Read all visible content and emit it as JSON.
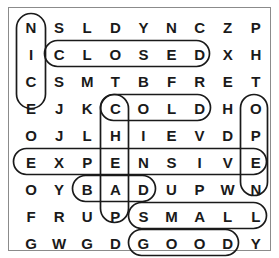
{
  "puzzle": {
    "title": "Word search puzzle grid",
    "rows": 9,
    "cols": 9,
    "border_color": "#8b8b8b",
    "letter_color": "#1a1a1a",
    "loop_color": "#1a1a1a",
    "grid": [
      [
        "N",
        "S",
        "L",
        "D",
        "Y",
        "N",
        "C",
        "Z",
        "P"
      ],
      [
        "I",
        "C",
        "L",
        "O",
        "S",
        "E",
        "D",
        "X",
        "H"
      ],
      [
        "C",
        "S",
        "M",
        "T",
        "B",
        "F",
        "R",
        "E",
        "T"
      ],
      [
        "E",
        "J",
        "K",
        "C",
        "O",
        "L",
        "D",
        "H",
        "O"
      ],
      [
        "O",
        "J",
        "L",
        "H",
        "I",
        "E",
        "V",
        "D",
        "P"
      ],
      [
        "E",
        "X",
        "P",
        "E",
        "N",
        "S",
        "I",
        "V",
        "E"
      ],
      [
        "O",
        "Y",
        "B",
        "A",
        "D",
        "U",
        "P",
        "W",
        "N"
      ],
      [
        "F",
        "R",
        "U",
        "P",
        "S",
        "M",
        "A",
        "L",
        "L"
      ],
      [
        "G",
        "W",
        "G",
        "D",
        "G",
        "O",
        "O",
        "D",
        "Y"
      ]
    ],
    "found_words": [
      {
        "word": "NICE",
        "direction": "vertical",
        "start_row": 1,
        "start_col": 1,
        "length": 4
      },
      {
        "word": "CLOSED",
        "direction": "horizontal",
        "start_row": 2,
        "start_col": 2,
        "length": 6
      },
      {
        "word": "COLD",
        "direction": "horizontal",
        "start_row": 4,
        "start_col": 4,
        "length": 4
      },
      {
        "word": "OPEN",
        "direction": "vertical",
        "start_row": 4,
        "start_col": 9,
        "length": 4
      },
      {
        "word": "CHEAP",
        "direction": "vertical",
        "start_row": 4,
        "start_col": 4,
        "length": 5
      },
      {
        "word": "EXPENSIVE",
        "direction": "horizontal",
        "start_row": 6,
        "start_col": 1,
        "length": 9
      },
      {
        "word": "BAD",
        "direction": "horizontal",
        "start_row": 7,
        "start_col": 3,
        "length": 3
      },
      {
        "word": "SMALL",
        "direction": "horizontal",
        "start_row": 8,
        "start_col": 5,
        "length": 5
      },
      {
        "word": "GOOD",
        "direction": "horizontal",
        "start_row": 9,
        "start_col": 5,
        "length": 4
      }
    ]
  }
}
